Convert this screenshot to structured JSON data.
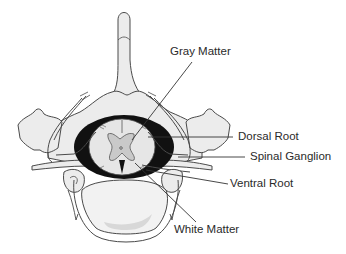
{
  "diagram": {
    "colors": {
      "background": "#ffffff",
      "bone_fill": "#ececec",
      "bone_stroke": "#4a4a4a",
      "cord_white_matter": "#e6e6e6",
      "gray_matter": "#c9c9c9",
      "dura_dark": "#111111",
      "vertebral_body_fill": "#f2f2f2",
      "vertebral_body_shade": "#d8d8d8",
      "leader_line": "#333333",
      "label_text": "#2a2a2a"
    },
    "labels": [
      {
        "id": "gray-matter",
        "text": "Gray Matter"
      },
      {
        "id": "dorsal-root",
        "text": "Dorsal Root"
      },
      {
        "id": "spinal-ganglion",
        "text": "Spinal Ganglion"
      },
      {
        "id": "ventral-root",
        "text": "Ventral Root"
      },
      {
        "id": "white-matter",
        "text": "White Matter"
      }
    ]
  }
}
